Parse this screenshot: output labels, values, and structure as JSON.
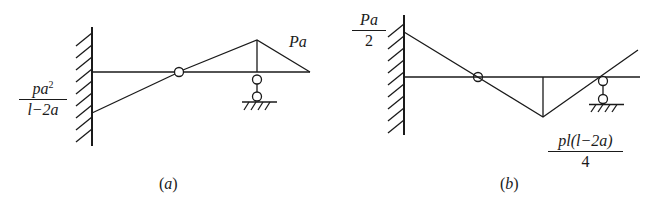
{
  "diagrams": [
    {
      "id": "a",
      "caption": "(a)",
      "caption_letter": "a",
      "labels": {
        "right_moment": "Pa",
        "left_moment_numerator_base": "pa",
        "left_moment_numerator_exp": "2",
        "left_moment_denominator": "l−2a"
      },
      "elements": [
        "fixed wall (left)",
        "beam",
        "intermediate hinge",
        "roller support",
        "moment diagram"
      ]
    },
    {
      "id": "b",
      "caption": "(b)",
      "caption_letter": "b",
      "labels": {
        "left_moment_numerator": "Pa",
        "left_moment_denominator": "2",
        "bottom_moment_numerator": "pl(l−2a)",
        "bottom_moment_denominator": "4"
      },
      "elements": [
        "fixed wall (left)",
        "beam",
        "intermediate hinge",
        "roller support",
        "moment diagram"
      ]
    }
  ],
  "colors": {
    "ink": "#1a1a1a",
    "background": "#ffffff"
  }
}
